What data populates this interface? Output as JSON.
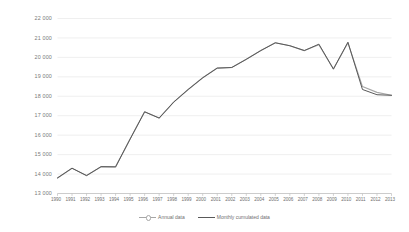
{
  "chart_data": {
    "type": "line",
    "title": "",
    "xlabel": "",
    "ylabel": "",
    "ylim": [
      13000,
      22000
    ],
    "ytick_step": 1000,
    "grid": true,
    "legend_position": "bottom-center",
    "categories": [
      "1990",
      "1991",
      "1992",
      "1993",
      "1994",
      "1995",
      "1996",
      "1997",
      "1998",
      "1999",
      "2000",
      "2001",
      "2002",
      "2003",
      "2004",
      "2005",
      "2006",
      "2007",
      "2008",
      "2009",
      "2010",
      "2011",
      "2012",
      "2013"
    ],
    "ytick_labels": [
      "22 000",
      "21 000",
      "20 000",
      "19 000",
      "18 000",
      "17 000",
      "16 000",
      "15 000",
      "14 000",
      "13 000"
    ],
    "ytick_values": [
      22000,
      21000,
      20000,
      19000,
      18000,
      17000,
      16000,
      15000,
      14000,
      13000
    ],
    "series": [
      {
        "name": "Annual data",
        "color": "#a6a6a6",
        "values": [
          13800,
          14300,
          13920,
          14380,
          14370,
          15800,
          17200,
          16880,
          17700,
          18350,
          18950,
          19450,
          19480,
          19900,
          20350,
          20750,
          20600,
          20350,
          20650,
          19400,
          20750,
          18500,
          18200,
          18050
        ]
      },
      {
        "name": "Monthly cumulated data",
        "color": "#595959",
        "values": [
          13800,
          14300,
          13920,
          14380,
          14370,
          15800,
          17200,
          16880,
          17700,
          18350,
          18950,
          19450,
          19480,
          19900,
          20350,
          20750,
          20600,
          20350,
          20680,
          19400,
          20780,
          18350,
          18080,
          18050
        ]
      }
    ],
    "legend": [
      {
        "label": "Annual data",
        "color": "#a6a6a6",
        "marker": "circle-line"
      },
      {
        "label": "Monthly cumulated data",
        "color": "#595959",
        "marker": "line"
      }
    ],
    "colors": {
      "grid": "#e8e8e8",
      "axis": "#bfbfbf",
      "text": "#6f6f6f",
      "background": "#ffffff"
    }
  }
}
